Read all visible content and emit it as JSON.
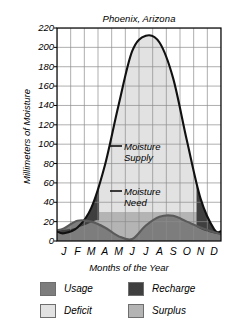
{
  "chart_data": {
    "type": "area",
    "title": "Phoenix, Arizona",
    "xlabel": "Months of the Year",
    "ylabel": "Millimeters of Moisture",
    "categories": [
      "J",
      "F",
      "M",
      "A",
      "M",
      "J",
      "J",
      "A",
      "S",
      "O",
      "N",
      "D"
    ],
    "ylim": [
      0,
      220
    ],
    "yticks": [
      0,
      20,
      40,
      60,
      80,
      100,
      120,
      140,
      160,
      180,
      200,
      220
    ],
    "grid": true,
    "legend_position": "below",
    "series": [
      {
        "name": "Moisture Supply",
        "values": [
          8,
          14,
          34,
          78,
          140,
          196,
          212,
          205,
          168,
          104,
          44,
          12
        ]
      },
      {
        "name": "Moisture Need",
        "values": [
          13,
          21,
          20,
          14,
          5,
          2,
          16,
          25,
          26,
          20,
          14,
          9
        ]
      }
    ],
    "annotations": [
      {
        "label": "Moisture Supply",
        "line1": "Moisture",
        "line2": "Supply"
      },
      {
        "label": "Moisture Need",
        "line1": "Moisture",
        "line2": "Need"
      }
    ],
    "bands": [
      {
        "name": "Usage",
        "color": "#7d7d7d"
      },
      {
        "name": "Recharge",
        "color": "#3f3f3f"
      },
      {
        "name": "Deficit",
        "color": "#e2e2e2"
      },
      {
        "name": "Surplus",
        "color": "#b4b4b4"
      }
    ]
  },
  "legend": {
    "items": [
      {
        "label": "Usage",
        "color": "#7d7d7d"
      },
      {
        "label": "Recharge",
        "color": "#3f3f3f"
      },
      {
        "label": "Deficit",
        "color": "#e2e2e2"
      },
      {
        "label": "Surplus",
        "color": "#b4b4b4"
      }
    ]
  },
  "colors": {
    "usage": "#7d7d7d",
    "recharge": "#3f3f3f",
    "deficit": "#e2e2e2",
    "surplus": "#b4b4b4",
    "curve": "#111111",
    "grid": "#8c8c8c",
    "axis": "#000000",
    "background": "#ffffff"
  }
}
